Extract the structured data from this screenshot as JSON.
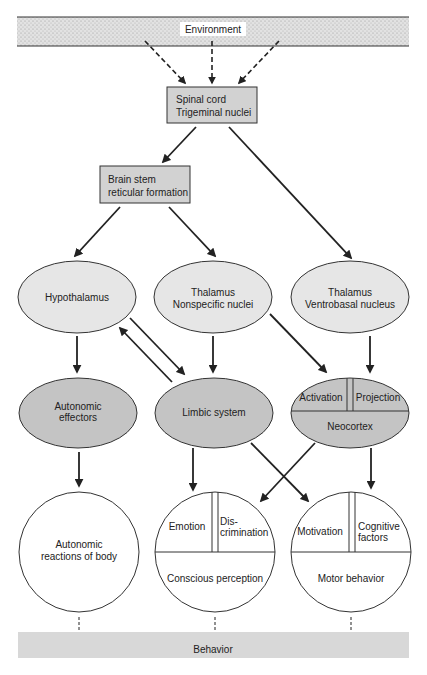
{
  "diagram": {
    "environment": "Environment",
    "spinal_cord": [
      "Spinal cord",
      "Trigeminal nuclei"
    ],
    "brain_stem": [
      "Brain stem",
      "reticular formation"
    ],
    "hypothalamus": "Hypothalamus",
    "thalamus_nonspecific": [
      "Thalamus",
      "Nonspecific nuclei"
    ],
    "thalamus_ventrobasal": [
      "Thalamus",
      "Ventrobasal nucleus"
    ],
    "autonomic_effectors": [
      "Autonomic",
      "effectors"
    ],
    "limbic_system": "Limbic system",
    "neocortex": {
      "activation": "Activation",
      "projection": "Projection",
      "label": "Neocortex"
    },
    "autonomic_reactions": [
      "Autonomic",
      "reactions of body"
    ],
    "perception": {
      "emotion": "Emotion",
      "discrimination": [
        "Dis-",
        "crimination"
      ],
      "label": "Conscious perception"
    },
    "motor": {
      "motivation": "Motivation",
      "cognitive": [
        "Cognitive",
        "factors"
      ],
      "label": "Motor behavior"
    },
    "behavior": "Behavior"
  },
  "colors": {
    "box_fill": "#d2d2d2",
    "ellipse_light": "#e6e6e6",
    "ellipse_dark": "#c4c4c4",
    "band": "#d8d8d8"
  }
}
